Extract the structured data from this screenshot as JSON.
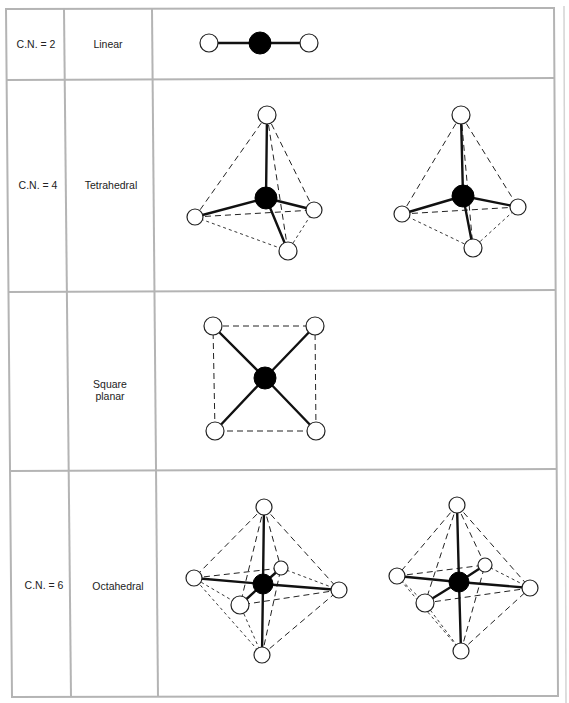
{
  "table": {
    "rows": [
      {
        "coordination_number": "C.N. = 2",
        "geometry_label": "Linear",
        "figures": [
          "linear"
        ]
      },
      {
        "coordination_number": "C.N. = 4",
        "geometry_label": "Tetrahedral",
        "figures": [
          "tetrahedral-1",
          "tetrahedral-2"
        ]
      },
      {
        "coordination_number": "",
        "geometry_label_line1": "Square",
        "geometry_label_line2": "planar",
        "figures": [
          "square-planar"
        ]
      },
      {
        "coordination_number": "C.N. = 6",
        "geometry_label": "Octahedral",
        "figures": [
          "octahedral-1",
          "octahedral-2"
        ]
      }
    ]
  },
  "legend": {
    "metal_atom": "filled black circle",
    "ligand_atom": "open white circle",
    "bond": "solid line",
    "polyhedron_edge": "dashed line"
  },
  "colors": {
    "grid": "#b4b4b4",
    "ink": "#111111",
    "background": "#ffffff"
  }
}
